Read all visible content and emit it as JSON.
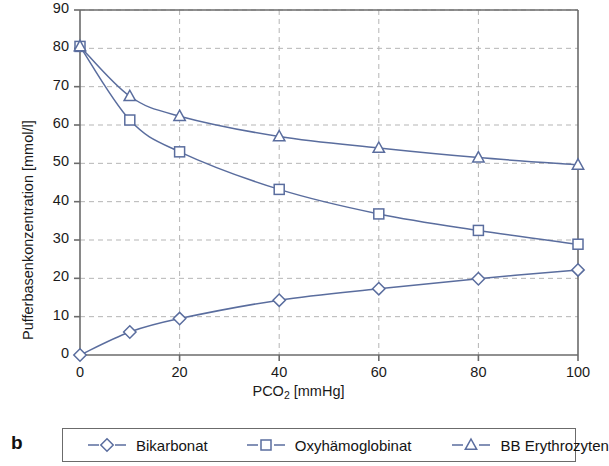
{
  "panel": {
    "label": "b"
  },
  "chart_data": {
    "type": "line",
    "title": "",
    "xlabel": "PCO2 [mmHg]",
    "xlabel_base": "PCO",
    "xlabel_sub": "2",
    "xlabel_unit": " [mmHg]",
    "ylabel": "Pufferbasenkonzentration [mmol/l]",
    "xlim": [
      0,
      100
    ],
    "ylim": [
      0,
      90
    ],
    "xticks": [
      0,
      20,
      40,
      60,
      80,
      100
    ],
    "yticks": [
      0,
      10,
      20,
      30,
      40,
      50,
      60,
      70,
      80,
      90
    ],
    "xtick_labels": [
      "0",
      "20",
      "40",
      "60",
      "80",
      "100"
    ],
    "ytick_labels": [
      "0",
      "10",
      "20",
      "30",
      "40",
      "50",
      "60",
      "70",
      "80",
      "90"
    ],
    "grid": "dashed horizontal and vertical",
    "legend_position": "below plot, boxed, horizontal",
    "x": [
      0,
      10,
      20,
      40,
      60,
      80,
      100
    ],
    "series": [
      {
        "name": "Bikarbonat",
        "marker": "diamond",
        "color": "#5a6d9e",
        "values": [
          0,
          6.0,
          9.5,
          14.3,
          17.3,
          19.9,
          22.2
        ]
      },
      {
        "name": "Oxyhämoglobinat",
        "marker": "square",
        "color": "#5a6d9e",
        "values": [
          80.5,
          61.3,
          53.0,
          43.2,
          36.8,
          32.5,
          28.9
        ]
      },
      {
        "name": "BB Erythrozyten",
        "marker": "triangle",
        "color": "#5a6d9e",
        "values": [
          80.5,
          67.5,
          62.3,
          57.0,
          54.0,
          51.5,
          49.6
        ]
      }
    ]
  },
  "style": {
    "line_color": "#5a6d9e",
    "marker_fill": "#ffffff",
    "grid_color": "#b5b5b5",
    "axis_color": "#6b6b6b",
    "text_color": "#1a1a1a"
  }
}
